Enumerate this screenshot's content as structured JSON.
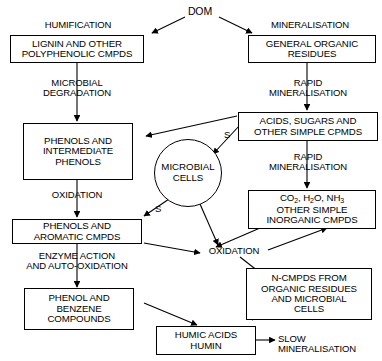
{
  "diagram": {
    "stroke_color": "#000000",
    "background_color": "#ffffff",
    "nodes": {
      "dom": "DOM",
      "lignin": "LIGNIN AND OTHER\nPOLYPHENOLIC CMPDS",
      "general_organic": "GENERAL ORGANIC\nRESIDUES",
      "phenols_intermediate": "PHENOLS AND\nINTERMEDIATE\nPHENOLS",
      "acids_sugars": "ACIDS, SUGARS AND\nOTHER SIMPLE CPMDS",
      "microbial_cells": "MICROBIAL\nCELLS",
      "phenols_aromatic": "PHENOLS AND\nAROMATIC CMPDS",
      "inorganic_line1_a": "CO",
      "inorganic_line1_sub1": "2",
      "inorganic_line1_b": ", H",
      "inorganic_line1_sub2": "2",
      "inorganic_line1_c": "O, NH",
      "inorganic_line1_sub3": "3",
      "inorganic_line2": "OTHER SIMPLE\nINORGANIC CMPDS",
      "phenol_benzene": "PHENOL AND\nBENZENE\nCOMPOUNDS",
      "n_cmpds": "N-CMPDS FROM\nORGANIC RESIDUES\nAND MICROBIAL\nCELLS",
      "humic_acids": "HUMIC ACIDS\nHUMIN"
    },
    "edge_labels": {
      "humification": "HUMIFICATION",
      "mineralisation": "MINERALISATION",
      "microbial_degradation": "MICROBIAL\nDEGRADATION",
      "rapid_mineralisation_top": "RAPID\nMINERALISATION",
      "rapid_mineralisation_mid": "RAPID\nMINERALISATION",
      "oxidation_left": "OXIDATION",
      "oxidation_center": "OXIDATION",
      "enzyme_action": "ENZYME ACTION\nAND AUTO-OXIDATION",
      "slow_mineralisation": "SLOW MINERALISATION",
      "s_acids_to_cells": "S",
      "s_cells_to_phenols": "S"
    }
  }
}
